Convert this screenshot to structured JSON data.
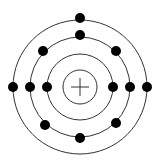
{
  "diagram": {
    "type": "bohr-atom-model",
    "nucleus": {
      "symbol": "+",
      "cx": 80,
      "cy": 87,
      "r": 17
    },
    "shells": [
      {
        "name": "shell-1",
        "r": 33,
        "electrons": [
          [
            47,
            87
          ],
          [
            113,
            87
          ]
        ]
      },
      {
        "name": "shell-2",
        "r": 50,
        "electrons": [
          [
            80,
            35
          ],
          [
            43,
            51
          ],
          [
            116,
            51
          ],
          [
            30,
            87
          ],
          [
            130,
            87
          ],
          [
            45,
            125
          ],
          [
            116,
            123
          ],
          [
            80,
            138
          ]
        ]
      },
      {
        "name": "shell-3",
        "r": 67,
        "electrons": [
          [
            80,
            18
          ],
          [
            13,
            87
          ],
          [
            147,
            87
          ]
        ]
      }
    ],
    "electron_radius": 5,
    "stroke_color": "#333333",
    "electron_color": "#000000"
  }
}
